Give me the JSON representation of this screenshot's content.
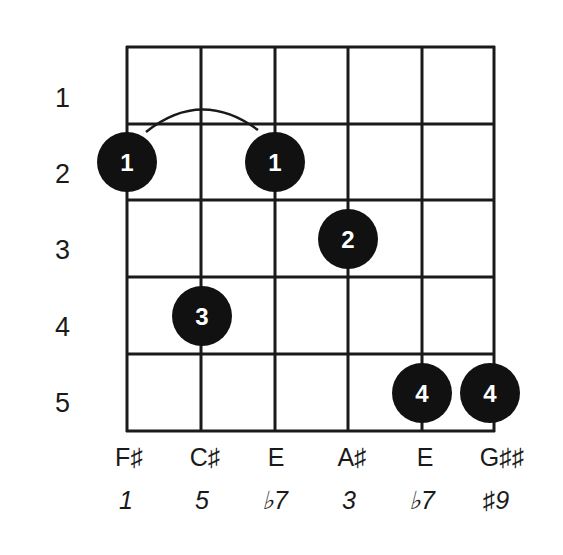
{
  "chord": {
    "frets_shown": [
      "1",
      "2",
      "3",
      "4",
      "5"
    ],
    "strings": [
      {
        "note": "F♯",
        "interval": "1"
      },
      {
        "note": "C♯",
        "interval": "5"
      },
      {
        "note": "E",
        "interval": "♭7"
      },
      {
        "note": "A♯",
        "interval": "3"
      },
      {
        "note": "E",
        "interval": "♭7"
      },
      {
        "note": "G♯♯",
        "interval": "♯9"
      }
    ],
    "fingerings": [
      {
        "string": 1,
        "fret": 2,
        "finger": "1"
      },
      {
        "string": 3,
        "fret": 2,
        "finger": "1"
      },
      {
        "string": 4,
        "fret": 3,
        "finger": "2"
      },
      {
        "string": 2,
        "fret": 4,
        "finger": "3"
      },
      {
        "string": 5,
        "fret": 5,
        "finger": "4"
      },
      {
        "string": 6,
        "fret": 5,
        "finger": "4"
      }
    ],
    "barre": {
      "finger": "1",
      "fret": 2,
      "from_string": 1,
      "to_string": 3
    }
  },
  "colors": {
    "ink": "#1a1a1a",
    "dot_fill": "#111111",
    "dot_text": "#ffffff",
    "background": "#ffffff"
  }
}
